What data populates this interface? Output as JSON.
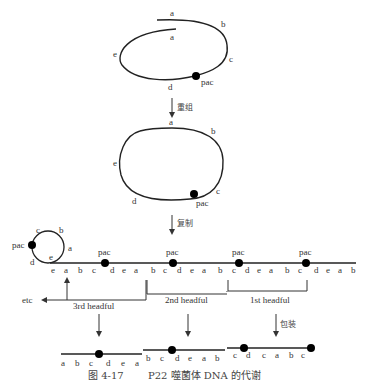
{
  "diagram": {
    "caption": {
      "figure": "图 4-17",
      "text": "P22 噬菌体 DNA 的代谢"
    },
    "stage1": {
      "labels": {
        "a_top": "a",
        "a_inner": "a",
        "b": "b",
        "c": "c",
        "d": "d",
        "e": "e",
        "pac": "pac"
      }
    },
    "step1_label": "重组",
    "stage2": {
      "labels": {
        "a": "a",
        "b": "b",
        "c": "c",
        "d": "d",
        "e": "e",
        "pac": "pac"
      }
    },
    "step2_label": "复制",
    "rolling_circle": {
      "circle_labels": {
        "c": "c",
        "b": "b",
        "a": "a",
        "e": "e",
        "d": "d",
        "pac": "pac"
      },
      "sequence": [
        "e",
        "a",
        "b",
        "c",
        "d",
        "e",
        "a",
        "b",
        "c",
        "d",
        "e",
        "a",
        "b",
        "c",
        "d",
        "e",
        "a",
        "b",
        "c",
        "d",
        "e",
        "a",
        "b"
      ],
      "pac_label": "pac",
      "headfuls": [
        "3rd headful",
        "2nd headful",
        "1st headful"
      ],
      "etc_label": "etc"
    },
    "step3_label": "包装",
    "packaged": [
      {
        "sequence": [
          "a",
          "b",
          "c",
          "d",
          "e",
          "a"
        ]
      },
      {
        "sequence": [
          "b",
          "c",
          "d",
          "e",
          "a",
          "b"
        ]
      },
      {
        "sequence": [
          "c",
          "d",
          "c",
          "a",
          "b",
          "c"
        ]
      }
    ]
  }
}
